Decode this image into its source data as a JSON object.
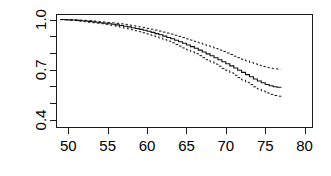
{
  "chart_data": {
    "type": "line",
    "title": "",
    "subtitle": "",
    "xlabel": "",
    "ylabel": "",
    "xlim": [
      48.5,
      81.0
    ],
    "ylim": [
      0.355,
      1.03
    ],
    "grid": false,
    "legend": "none",
    "x_ticks": [
      50,
      55,
      60,
      65,
      70,
      75,
      80
    ],
    "x_tick_labels": [
      "50",
      "55",
      "60",
      "65",
      "70",
      "75",
      "80"
    ],
    "y_ticks": [
      0.4,
      0.5,
      0.6,
      0.7,
      0.8,
      0.9,
      1.0
    ],
    "y_tick_labels": [
      "0.4",
      "",
      "",
      "0.7",
      "",
      "",
      "1.0"
    ],
    "y_labeled_ticks": [
      0.4,
      0.7,
      1.0
    ],
    "style": "step",
    "series": [
      {
        "name": "survival",
        "style": "solid",
        "x": [
          49.0,
          49.5,
          50.0,
          50.5,
          51.0,
          51.5,
          52.0,
          52.5,
          53.0,
          53.5,
          54.0,
          54.5,
          55.0,
          55.5,
          56.0,
          56.5,
          57.0,
          57.5,
          58.0,
          58.5,
          59.0,
          59.5,
          60.0,
          60.5,
          61.0,
          61.5,
          62.0,
          62.5,
          63.0,
          63.5,
          64.0,
          64.5,
          65.0,
          65.5,
          66.0,
          66.5,
          67.0,
          67.5,
          68.0,
          68.5,
          69.0,
          69.5,
          70.0,
          70.5,
          71.0,
          71.5,
          72.0,
          72.5,
          73.0,
          73.5,
          74.0,
          74.5,
          75.0,
          75.5,
          76.0,
          76.5,
          77.0
        ],
        "values": [
          1.0,
          0.999,
          0.998,
          0.997,
          0.995,
          0.993,
          0.991,
          0.989,
          0.987,
          0.984,
          0.981,
          0.978,
          0.975,
          0.972,
          0.968,
          0.964,
          0.96,
          0.956,
          0.951,
          0.946,
          0.941,
          0.936,
          0.93,
          0.923,
          0.916,
          0.909,
          0.901,
          0.893,
          0.885,
          0.876,
          0.867,
          0.858,
          0.848,
          0.838,
          0.828,
          0.817,
          0.806,
          0.795,
          0.784,
          0.772,
          0.76,
          0.748,
          0.736,
          0.723,
          0.71,
          0.697,
          0.684,
          0.671,
          0.658,
          0.645,
          0.633,
          0.622,
          0.612,
          0.604,
          0.598,
          0.595,
          0.594
        ]
      },
      {
        "name": "upper-confidence-limit",
        "style": "dashed",
        "x": [
          49.0,
          49.5,
          50.0,
          50.5,
          51.0,
          51.5,
          52.0,
          52.5,
          53.0,
          53.5,
          54.0,
          54.5,
          55.0,
          55.5,
          56.0,
          56.5,
          57.0,
          57.5,
          58.0,
          58.5,
          59.0,
          59.5,
          60.0,
          60.5,
          61.0,
          61.5,
          62.0,
          62.5,
          63.0,
          63.5,
          64.0,
          64.5,
          65.0,
          65.5,
          66.0,
          66.5,
          67.0,
          67.5,
          68.0,
          68.5,
          69.0,
          69.5,
          70.0,
          70.5,
          71.0,
          71.5,
          72.0,
          72.5,
          73.0,
          73.5,
          74.0,
          74.5,
          75.0,
          75.5,
          76.0,
          76.5,
          77.0
        ],
        "values": [
          1.0,
          1.0,
          0.999,
          0.999,
          0.998,
          0.996,
          0.995,
          0.993,
          0.991,
          0.989,
          0.987,
          0.985,
          0.982,
          0.98,
          0.977,
          0.974,
          0.971,
          0.967,
          0.964,
          0.96,
          0.956,
          0.952,
          0.947,
          0.942,
          0.937,
          0.931,
          0.925,
          0.919,
          0.913,
          0.906,
          0.899,
          0.892,
          0.884,
          0.877,
          0.869,
          0.861,
          0.853,
          0.844,
          0.836,
          0.827,
          0.818,
          0.809,
          0.8,
          0.791,
          0.781,
          0.772,
          0.762,
          0.753,
          0.744,
          0.735,
          0.727,
          0.72,
          0.714,
          0.709,
          0.706,
          0.704,
          0.703
        ]
      },
      {
        "name": "lower-confidence-limit",
        "style": "dashed",
        "x": [
          49.0,
          49.5,
          50.0,
          50.5,
          51.0,
          51.5,
          52.0,
          52.5,
          53.0,
          53.5,
          54.0,
          54.5,
          55.0,
          55.5,
          56.0,
          56.5,
          57.0,
          57.5,
          58.0,
          58.5,
          59.0,
          59.5,
          60.0,
          60.5,
          61.0,
          61.5,
          62.0,
          62.5,
          63.0,
          63.5,
          64.0,
          64.5,
          65.0,
          65.5,
          66.0,
          66.5,
          67.0,
          67.5,
          68.0,
          68.5,
          69.0,
          69.5,
          70.0,
          70.5,
          71.0,
          71.5,
          72.0,
          72.5,
          73.0,
          73.5,
          74.0,
          74.5,
          75.0,
          75.5,
          76.0,
          76.5,
          77.0
        ],
        "values": [
          0.999,
          0.998,
          0.996,
          0.994,
          0.992,
          0.99,
          0.987,
          0.984,
          0.981,
          0.978,
          0.975,
          0.971,
          0.967,
          0.963,
          0.959,
          0.954,
          0.949,
          0.944,
          0.939,
          0.933,
          0.927,
          0.921,
          0.914,
          0.906,
          0.898,
          0.889,
          0.88,
          0.871,
          0.861,
          0.851,
          0.841,
          0.83,
          0.819,
          0.808,
          0.796,
          0.784,
          0.772,
          0.76,
          0.747,
          0.734,
          0.721,
          0.708,
          0.695,
          0.681,
          0.667,
          0.653,
          0.639,
          0.625,
          0.611,
          0.598,
          0.585,
          0.573,
          0.562,
          0.553,
          0.546,
          0.542,
          0.54
        ]
      }
    ]
  }
}
